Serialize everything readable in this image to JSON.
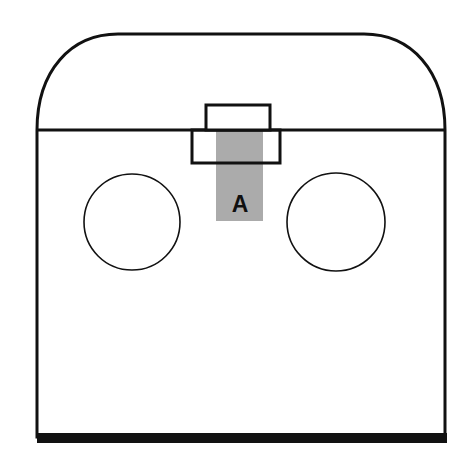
{
  "figure": {
    "background_color": "#ffffff",
    "outline_color": "#111111",
    "fill_color": "#ffffff",
    "shaded_color": "#ababab",
    "base_bar_color": "#111111",
    "labels": [
      {
        "id": "region-a",
        "text": "A",
        "x": 240,
        "y": 206,
        "color": "#101010",
        "font_size": 23,
        "bold": true
      }
    ],
    "geometry": {
      "body": {
        "left": 37,
        "right": 445,
        "top": 130,
        "bottom": 437,
        "stroke_width": 3
      },
      "dome": {
        "apex_y": 34,
        "left_tangent_x": 118,
        "right_tangent_x": 364,
        "stroke_width": 3
      },
      "circles": [
        {
          "id": "left-port",
          "cx": 132,
          "cy": 222,
          "r": 48,
          "stroke_width": 1.6
        },
        {
          "id": "right-port",
          "cx": 336,
          "cy": 222,
          "r": 49,
          "stroke_width": 1.6
        }
      ],
      "upper_rect": {
        "x": 206,
        "y": 105,
        "width": 64,
        "height": 25,
        "stroke_width": 3
      },
      "lower_rect": {
        "x": 192,
        "y": 130,
        "width": 88,
        "height": 33,
        "stroke_width": 3
      },
      "shaded_column": {
        "x": 216,
        "y": 130,
        "width": 47,
        "height": 91
      },
      "base_bar": {
        "x": 37,
        "y": 433,
        "width": 410,
        "height": 10
      }
    }
  }
}
